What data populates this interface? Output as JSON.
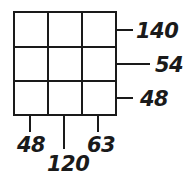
{
  "diagram": {
    "type": "3x3 grid puzzle",
    "grid": {
      "rows": 3,
      "cols": 3
    },
    "row_clues": [
      "140",
      "54",
      "48"
    ],
    "column_clues": [
      "48",
      "120",
      "63"
    ],
    "line_color": "#1a1a1a"
  }
}
